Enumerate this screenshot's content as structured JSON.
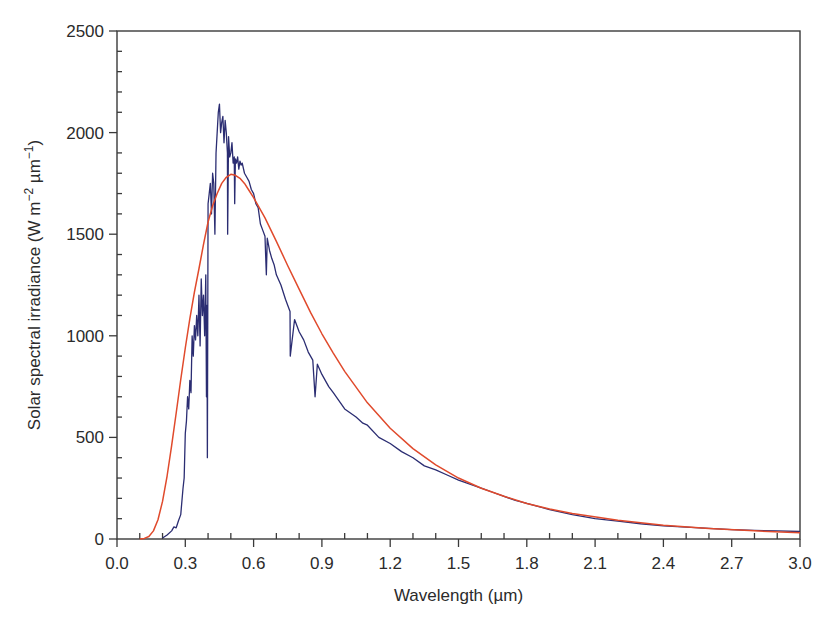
{
  "chart_data": {
    "type": "line",
    "title": "",
    "xlabel": "Wavelength (µm)",
    "ylabel_parts": {
      "prefix": "Solar spectral irradiance (W m",
      "sup1": "−2",
      "mid": " µm",
      "sup2": "−1",
      "suffix": ")"
    },
    "xlim": [
      0.0,
      3.0
    ],
    "ylim": [
      0,
      2500
    ],
    "x_major_ticks": [
      0.0,
      0.3,
      0.6,
      0.9,
      1.2,
      1.5,
      1.8,
      2.1,
      2.4,
      2.7,
      3.0
    ],
    "x_tick_labels": [
      "0.0",
      "0.3",
      "0.6",
      "0.9",
      "1.2",
      "1.5",
      "1.8",
      "2.1",
      "2.4",
      "2.7",
      "3.0"
    ],
    "x_minor_step": 0.1,
    "y_major_ticks": [
      0,
      500,
      1000,
      1500,
      2000,
      2500
    ],
    "y_tick_labels": [
      "0",
      "500",
      "1000",
      "1500",
      "2000",
      "2500"
    ],
    "y_minor_step": 100,
    "grid": false,
    "legend": "none",
    "series": [
      {
        "name": "Measured solar spectrum",
        "color": "#2b2d72",
        "x": [
          0.2,
          0.22,
          0.24,
          0.25,
          0.26,
          0.27,
          0.28,
          0.29,
          0.295,
          0.3,
          0.305,
          0.31,
          0.315,
          0.32,
          0.325,
          0.33,
          0.335,
          0.34,
          0.345,
          0.35,
          0.355,
          0.36,
          0.365,
          0.37,
          0.375,
          0.38,
          0.385,
          0.39,
          0.393,
          0.395,
          0.397,
          0.4,
          0.405,
          0.41,
          0.415,
          0.42,
          0.425,
          0.43,
          0.435,
          0.44,
          0.445,
          0.45,
          0.455,
          0.46,
          0.465,
          0.47,
          0.475,
          0.48,
          0.485,
          0.486,
          0.49,
          0.495,
          0.5,
          0.505,
          0.51,
          0.515,
          0.517,
          0.52,
          0.525,
          0.53,
          0.535,
          0.54,
          0.545,
          0.55,
          0.56,
          0.57,
          0.58,
          0.59,
          0.6,
          0.61,
          0.62,
          0.63,
          0.64,
          0.65,
          0.656,
          0.66,
          0.67,
          0.68,
          0.69,
          0.7,
          0.72,
          0.74,
          0.76,
          0.761,
          0.78,
          0.8,
          0.82,
          0.84,
          0.86,
          0.87,
          0.88,
          0.9,
          0.93,
          0.95,
          1.0,
          1.05,
          1.08,
          1.1,
          1.15,
          1.2,
          1.25,
          1.3,
          1.35,
          1.4,
          1.45,
          1.5,
          1.55,
          1.6,
          1.65,
          1.7,
          1.75,
          1.8,
          1.9,
          2.0,
          2.1,
          2.2,
          2.3,
          2.4,
          2.5,
          2.6,
          2.7,
          2.8,
          2.9,
          3.0
        ],
        "y": [
          5,
          20,
          40,
          60,
          55,
          90,
          120,
          250,
          300,
          520,
          580,
          700,
          640,
          780,
          720,
          1000,
          900,
          1050,
          980,
          1100,
          1000,
          1200,
          950,
          1280,
          1100,
          1200,
          1000,
          1300,
          700,
          1150,
          400,
          1650,
          1700,
          1750,
          1600,
          1800,
          1750,
          1500,
          1900,
          2000,
          2100,
          2140,
          2000,
          2050,
          2080,
          1950,
          2060,
          2000,
          1900,
          1500,
          1980,
          1880,
          1900,
          1950,
          1850,
          1880,
          1650,
          1870,
          1850,
          1880,
          1820,
          1860,
          1840,
          1850,
          1800,
          1780,
          1760,
          1720,
          1700,
          1650,
          1630,
          1550,
          1520,
          1490,
          1300,
          1480,
          1420,
          1380,
          1350,
          1300,
          1250,
          1180,
          1120,
          900,
          1080,
          1020,
          980,
          920,
          880,
          700,
          860,
          810,
          750,
          720,
          640,
          600,
          570,
          560,
          500,
          470,
          430,
          400,
          360,
          340,
          315,
          290,
          270,
          250,
          230,
          210,
          190,
          175,
          145,
          120,
          100,
          88,
          75,
          65,
          58,
          52,
          46,
          42,
          40,
          37
        ]
      },
      {
        "name": "Blackbody curve",
        "color": "#e04a2c",
        "x": [
          0.1,
          0.12,
          0.14,
          0.16,
          0.18,
          0.2,
          0.22,
          0.24,
          0.26,
          0.28,
          0.3,
          0.32,
          0.34,
          0.36,
          0.38,
          0.4,
          0.42,
          0.44,
          0.46,
          0.48,
          0.5,
          0.52,
          0.54,
          0.56,
          0.58,
          0.6,
          0.65,
          0.7,
          0.75,
          0.8,
          0.85,
          0.9,
          0.95,
          1.0,
          1.1,
          1.2,
          1.3,
          1.4,
          1.5,
          1.6,
          1.7,
          1.8,
          1.9,
          2.0,
          2.2,
          2.4,
          2.6,
          2.8,
          3.0
        ],
        "y": [
          0,
          3,
          12,
          40,
          95,
          185,
          310,
          460,
          620,
          785,
          940,
          1085,
          1215,
          1330,
          1450,
          1560,
          1640,
          1700,
          1750,
          1780,
          1795,
          1790,
          1775,
          1750,
          1715,
          1680,
          1580,
          1465,
          1345,
          1230,
          1115,
          1010,
          915,
          825,
          670,
          545,
          445,
          365,
          300,
          250,
          210,
          175,
          148,
          126,
          92,
          68,
          52,
          40,
          31
        ]
      }
    ]
  }
}
